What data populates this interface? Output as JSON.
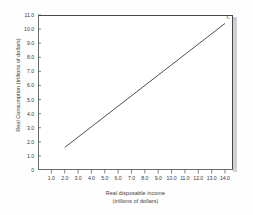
{
  "chart_data": {
    "type": "line",
    "title": "",
    "xlabel": "Real disposable income",
    "xlabel_units": "(trillions of dollars)",
    "ylabel": "Real Consumption (trillions of dollars)",
    "xlim": [
      0,
      14.6
    ],
    "ylim": [
      0,
      11.0
    ],
    "grid": false,
    "legend": "none",
    "xticks": [
      "1.0",
      "2.0",
      "3.0",
      "4.0",
      "5.0",
      "6.0",
      "7.0",
      "8.0",
      "9.0",
      "10.0",
      "11.0",
      "12.0",
      "13.0",
      "14.0"
    ],
    "xtick_values": [
      1.0,
      2.0,
      3.0,
      4.0,
      5.0,
      6.0,
      7.0,
      8.0,
      9.0,
      10.0,
      11.0,
      12.0,
      13.0,
      14.0
    ],
    "yticks": [
      "0",
      "1.0",
      "2.0",
      "3.0",
      "4.0",
      "5.0",
      "6.0",
      "7.0",
      "8.0",
      "9.0",
      "10.0",
      "11.0"
    ],
    "ytick_values": [
      0,
      1.0,
      2.0,
      3.0,
      4.0,
      5.0,
      6.0,
      7.0,
      8.0,
      9.0,
      10.0,
      11.0
    ],
    "series": [
      {
        "name": "C",
        "label": "C",
        "color": "#3c3c3c",
        "x": [
          2.0,
          14.0
        ],
        "values": [
          1.6,
          10.4
        ],
        "slope": 0.733,
        "intercept": 0.133
      }
    ],
    "annotations": [
      {
        "text": "C",
        "x": 14.0,
        "y": 10.4
      }
    ]
  },
  "colors": {
    "line": "#3c3c3c",
    "axis": "#4a4a4a",
    "text": "#3a3a3a",
    "background": "#ffffff",
    "shadow": "#c9c9c9"
  }
}
